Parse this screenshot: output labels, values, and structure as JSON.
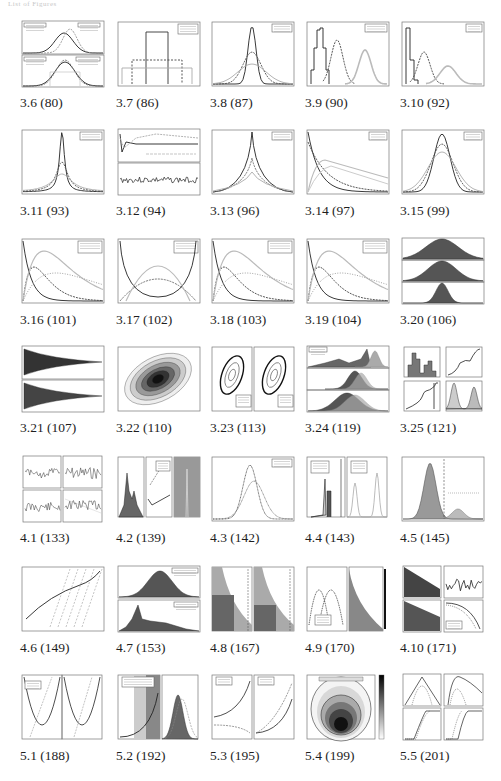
{
  "header": {
    "text": "List of Figures"
  },
  "figures": [
    {
      "id": "3.6",
      "caption": "3.6 (80)",
      "kind": "stacked-gauss"
    },
    {
      "id": "3.7",
      "caption": "3.7 (86)",
      "kind": "uniform-bars"
    },
    {
      "id": "3.8",
      "caption": "3.8 (87)",
      "kind": "peaks"
    },
    {
      "id": "3.9",
      "caption": "3.9 (90)",
      "kind": "multi-hist"
    },
    {
      "id": "3.10",
      "caption": "3.10 (92)",
      "kind": "decay-hist"
    },
    {
      "id": "3.11",
      "caption": "3.11 (93)",
      "kind": "cauchy"
    },
    {
      "id": "3.12",
      "caption": "3.12 (94)",
      "kind": "trace2"
    },
    {
      "id": "3.13",
      "caption": "3.13 (96)",
      "kind": "laplace"
    },
    {
      "id": "3.14",
      "caption": "3.14 (97)",
      "kind": "decays"
    },
    {
      "id": "3.15",
      "caption": "3.15 (99)",
      "kind": "bell3"
    },
    {
      "id": "3.16",
      "caption": "3.16 (101)",
      "kind": "gamma"
    },
    {
      "id": "3.17",
      "caption": "3.17 (102)",
      "kind": "beta"
    },
    {
      "id": "3.18",
      "caption": "3.18 (103)",
      "kind": "gamma"
    },
    {
      "id": "3.19",
      "caption": "3.19 (104)",
      "kind": "gamma"
    },
    {
      "id": "3.20",
      "caption": "3.20 (106)",
      "kind": "filled3"
    },
    {
      "id": "3.21",
      "caption": "3.21 (107)",
      "kind": "funnel"
    },
    {
      "id": "3.22",
      "caption": "3.22 (110)",
      "kind": "ellipse"
    },
    {
      "id": "3.23",
      "caption": "3.23 (113)",
      "kind": "ellipse2"
    },
    {
      "id": "3.24",
      "caption": "3.24 (119)",
      "kind": "hist3"
    },
    {
      "id": "3.25",
      "caption": "3.25 (121)",
      "kind": "grid4"
    },
    {
      "id": "4.1",
      "caption": "4.1 (133)",
      "kind": "noise4"
    },
    {
      "id": "4.2",
      "caption": "4.2 (139)",
      "kind": "tri-panel"
    },
    {
      "id": "4.3",
      "caption": "4.3 (142)",
      "kind": "bell2"
    },
    {
      "id": "4.4",
      "caption": "4.4 (143)",
      "kind": "bars-peaks"
    },
    {
      "id": "4.5",
      "caption": "4.5 (145)",
      "kind": "bimodal"
    },
    {
      "id": "4.6",
      "caption": "4.6 (149)",
      "kind": "curve-lines"
    },
    {
      "id": "4.7",
      "caption": "4.7 (153)",
      "kind": "filled2"
    },
    {
      "id": "4.8",
      "caption": "4.8 (167)",
      "kind": "regions2"
    },
    {
      "id": "4.9",
      "caption": "4.9 (170)",
      "kind": "arches"
    },
    {
      "id": "4.10",
      "caption": "4.10 (171)",
      "kind": "grid4b"
    },
    {
      "id": "5.1",
      "caption": "5.1 (188)",
      "kind": "parabolas"
    },
    {
      "id": "5.2",
      "caption": "5.2 (192)",
      "kind": "cdf-hist"
    },
    {
      "id": "5.3",
      "caption": "5.3 (195)",
      "kind": "curves2"
    },
    {
      "id": "5.4",
      "caption": "5.4 (199)",
      "kind": "contour"
    },
    {
      "id": "5.5",
      "caption": "5.5 (201)",
      "kind": "grid4c"
    }
  ],
  "layout": {
    "columns_x": [
      20,
      116,
      210,
      305,
      400
    ],
    "rows_y": [
      20,
      128,
      237,
      345,
      455,
      565,
      673
    ]
  }
}
